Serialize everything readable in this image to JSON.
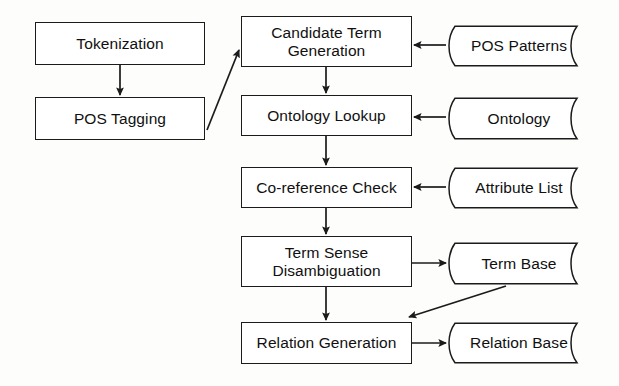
{
  "diagram": {
    "type": "flowchart",
    "background_color": "#fdfdfc",
    "stroke_color": "#1b1b1b",
    "text_color": "#101010",
    "nodes": [
      {
        "id": "tokenization",
        "label": "Tokenization",
        "shape": "process",
        "x": 35,
        "y": 22,
        "w": 170,
        "h": 43
      },
      {
        "id": "pos_tagging",
        "label": "POS Tagging",
        "shape": "process",
        "x": 35,
        "y": 97,
        "w": 170,
        "h": 43
      },
      {
        "id": "candidate",
        "label": "Candidate Term\nGeneration",
        "shape": "process",
        "x": 241,
        "y": 16,
        "w": 171,
        "h": 51
      },
      {
        "id": "ontology_lookup",
        "label": "Ontology Lookup",
        "shape": "process",
        "x": 241,
        "y": 95,
        "w": 171,
        "h": 41
      },
      {
        "id": "coreference",
        "label": "Co-reference Check",
        "shape": "process",
        "x": 241,
        "y": 167,
        "w": 171,
        "h": 41
      },
      {
        "id": "disambiguation",
        "label": "Term Sense\nDisambiguation",
        "shape": "process",
        "x": 241,
        "y": 236,
        "w": 171,
        "h": 51
      },
      {
        "id": "relation_gen",
        "label": "Relation Generation",
        "shape": "process",
        "x": 241,
        "y": 322,
        "w": 171,
        "h": 42
      },
      {
        "id": "pos_patterns",
        "label": "POS Patterns",
        "shape": "store",
        "x": 443,
        "y": 25,
        "w": 146,
        "h": 42
      },
      {
        "id": "ontology",
        "label": "Ontology",
        "shape": "store",
        "x": 443,
        "y": 97,
        "w": 146,
        "h": 43
      },
      {
        "id": "attribute_list",
        "label": "Attribute List",
        "shape": "store",
        "x": 443,
        "y": 167,
        "w": 146,
        "h": 42
      },
      {
        "id": "term_base",
        "label": "Term Base",
        "shape": "store",
        "x": 443,
        "y": 242,
        "w": 146,
        "h": 43
      },
      {
        "id": "relation_base",
        "label": "Relation Base",
        "shape": "store",
        "x": 443,
        "y": 322,
        "w": 146,
        "h": 42
      }
    ],
    "edges": [
      {
        "id": "e1",
        "from": "tokenization",
        "to": "pos_tagging",
        "kind": "vertical"
      },
      {
        "id": "e2",
        "from": "pos_tagging",
        "to": "candidate",
        "kind": "diagonal"
      },
      {
        "id": "e3",
        "from": "candidate",
        "to": "ontology_lookup",
        "kind": "vertical"
      },
      {
        "id": "e4",
        "from": "ontology_lookup",
        "to": "coreference",
        "kind": "vertical"
      },
      {
        "id": "e5",
        "from": "coreference",
        "to": "disambiguation",
        "kind": "vertical"
      },
      {
        "id": "e6",
        "from": "disambiguation",
        "to": "relation_gen",
        "kind": "vertical"
      },
      {
        "id": "e7",
        "from": "pos_patterns",
        "to": "candidate",
        "kind": "horizontal-left"
      },
      {
        "id": "e8",
        "from": "ontology",
        "to": "ontology_lookup",
        "kind": "horizontal-left"
      },
      {
        "id": "e9",
        "from": "attribute_list",
        "to": "coreference",
        "kind": "horizontal-left"
      },
      {
        "id": "e10",
        "from": "disambiguation",
        "to": "term_base",
        "kind": "horizontal-right"
      },
      {
        "id": "e11",
        "from": "term_base",
        "to": "relation_gen",
        "kind": "diagonal"
      },
      {
        "id": "e12",
        "from": "relation_gen",
        "to": "relation_base",
        "kind": "horizontal-right"
      }
    ]
  }
}
